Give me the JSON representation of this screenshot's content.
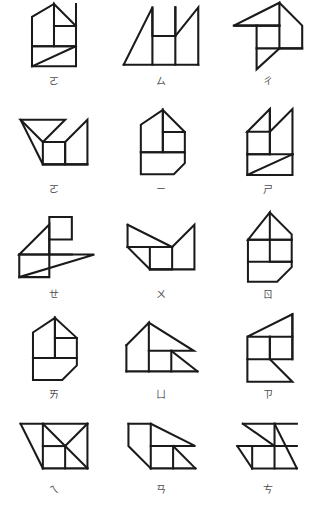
{
  "page": {
    "background_color": "#ffffff",
    "stroke_color": "#1a1a1a",
    "label_color": "#4d4d4d",
    "columns": 3,
    "rows": 5,
    "total_figures": 15
  },
  "figures": [
    {
      "index": 1,
      "row": 1,
      "column": 1,
      "label": "ㄛ",
      "name": "tangram-figure-1",
      "paths": [
        "M 8 46 L 8 14 L 32 0 L 32 46 Z",
        "M 32 46 L 32 24 L 56 24 L 56 46 Z",
        "M 32 24 L 32 0 L 56 24 Z",
        "M 56 46 L 56 0 L 56 46",
        "M 8 46 L 56 46",
        "M 8 46 L 8 68 L 56 68 L 56 46",
        "M 8 68 L 56 46"
      ],
      "viewbox": "-4 -4 72 80",
      "width": 66,
      "height": 76
    },
    {
      "index": 2,
      "row": 1,
      "column": 2,
      "label": "ㄙ",
      "name": "tangram-figure-2",
      "paths": [
        "M 2 66 L 32 6 L 32 66",
        "M 32 6 L 32 36 L 56 36 L 56 6 L 56 66",
        "M 32 36 L 56 36",
        "M 32 66 L 56 66",
        "M 56 36 L 80 6 L 80 66 L 56 66",
        "M 2 66 L 80 66"
      ],
      "viewbox": "-4 0 90 74",
      "width": 86,
      "height": 72
    },
    {
      "index": 3,
      "row": 1,
      "column": 3,
      "label": "ㄔ",
      "name": "tangram-figure-3",
      "paths": [
        "M 0 28 L 48 4 L 48 28 Z",
        "M 48 4 L 72 28 L 72 52 L 48 52 L 48 28 Z",
        "M 24 28 L 24 52 L 48 52 L 48 28 Z",
        "M 0 28 L 48 28",
        "M 24 52 L 48 52",
        "M 24 52 L 24 74 L 48 52",
        "M 48 52 L 72 52"
      ],
      "viewbox": "-4 0 80 80",
      "width": 76,
      "height": 78
    },
    {
      "index": 4,
      "row": 2,
      "column": 1,
      "label": "ㄛ",
      "name": "tangram-figure-4",
      "paths": [
        "M 2 22 L 50 22 L 26 46 Z",
        "M 2 22 L 26 70 L 26 46",
        "M 26 46 L 26 70 L 50 70 L 50 46 Z",
        "M 26 46 L 50 46",
        "M 50 46 L 50 70 L 74 70 L 74 22 L 50 46",
        "M 26 70 L 74 70"
      ],
      "viewbox": "-4 16 84 62",
      "width": 78,
      "height": 60
    },
    {
      "index": 5,
      "row": 2,
      "column": 2,
      "label": "ㄧ",
      "name": "tangram-figure-5",
      "paths": [
        "M 10 46 L 10 16 L 34 0 L 34 46 Z",
        "M 34 46 L 34 24 L 58 24 L 58 46 Z",
        "M 34 24 L 34 0 L 58 24 Z",
        "M 10 46 L 58 46",
        "M 10 46 L 10 70 L 46 70 L 58 58 L 58 46",
        "M 46 70 L 58 58"
      ],
      "viewbox": "-4 -4 72 80",
      "width": 66,
      "height": 76
    },
    {
      "index": 6,
      "row": 2,
      "column": 3,
      "label": "ㄕ",
      "name": "tangram-figure-6",
      "paths": [
        "M 8 24 L 32 0 L 32 24 Z",
        "M 8 24 L 8 48 L 32 48 L 32 24 Z",
        "M 32 48 L 32 0 L 56 0 L 56 48 Z",
        "M 8 24 L 56 24",
        "M 8 48 L 56 48",
        "M 8 48 L 8 70 L 56 70 L 56 48",
        "M 8 70 L 56 48"
      ],
      "viewbox": "-4 -4 68 80",
      "width": 64,
      "height": 76
    },
    {
      "index": 7,
      "row": 3,
      "column": 1,
      "label": "ㄝ",
      "name": "tangram-figure-7",
      "paths": [
        "M 8 40 L 40 8 L 40 40 Z",
        "M 40 8 L 40 0 L 40 24 L 64 24 L 64 0",
        "M 40 24 L 64 24",
        "M 8 40 L 64 40",
        "M 8 40 L 8 64 L 40 64 L 40 40",
        "M 8 64 L 40 64 L 88 40 L 40 40",
        "M 40 0 L 64 24"
      ],
      "viewbox": "-4 -4 98 74",
      "width": 92,
      "height": 70
    },
    {
      "index": 8,
      "row": 3,
      "column": 2,
      "label": "ㄨ",
      "name": "tangram-figure-8",
      "paths": [
        "M 2 8 L 2 32 L 26 32 L 50 8",
        "M 2 8 L 50 32 L 50 8",
        "M 2 32 L 26 56 L 26 32",
        "M 26 32 L 26 56 L 50 56 L 50 32 Z",
        "M 2 32 L 50 32",
        "M 26 56 L 74 56 L 74 8 L 50 32",
        "M 50 32 L 50 56"
      ],
      "viewbox": "-4 2 84 62",
      "width": 78,
      "height": 58
    },
    {
      "index": 9,
      "row": 3,
      "column": 3,
      "label": "ㄖ",
      "name": "tangram-figure-9",
      "paths": [
        "M 8 30 L 32 0 L 32 30 Z",
        "M 32 0 L 56 24 L 56 30 L 32 30 Z",
        "M 32 30 L 32 54 L 56 54 L 56 30",
        "M 8 30 L 56 30",
        "M 8 30 L 8 54 L 56 54",
        "M 8 54 L 8 76 L 40 76 L 56 60 L 56 54",
        "M 40 76 L 56 60"
      ],
      "viewbox": "-4 -4 68 86",
      "width": 62,
      "height": 80
    },
    {
      "index": 10,
      "row": 4,
      "column": 1,
      "label": "ㄞ",
      "name": "tangram-figure-10",
      "paths": [
        "M 8 44 L 8 16 L 32 0 L 32 44 Z",
        "M 32 44 L 32 22 L 56 22 L 56 44 Z",
        "M 32 22 L 32 0 L 56 22 Z",
        "M 8 44 L 56 44",
        "M 8 44 L 8 68 L 40 68 L 56 52 L 56 44",
        "M 40 68 L 56 52"
      ],
      "viewbox": "-4 -8 70 82",
      "width": 64,
      "height": 78
    },
    {
      "index": 11,
      "row": 4,
      "column": 2,
      "label": "ㄩ",
      "name": "tangram-figure-11",
      "paths": [
        "M 4 28 L 28 4 L 28 56",
        "M 4 28 L 4 56 L 28 56",
        "M 28 4 L 76 34 L 28 34",
        "M 28 34 L 52 34 L 52 56 L 28 56 Z",
        "M 52 34 L 80 56 L 52 56",
        "M 4 56 L 80 56"
      ],
      "viewbox": "-4 0 90 62",
      "width": 86,
      "height": 58
    },
    {
      "index": 12,
      "row": 4,
      "column": 3,
      "label": "ㄗ",
      "name": "tangram-figure-12",
      "paths": [
        "M 6 24 L 54 0 L 54 24 Z",
        "M 6 24 L 6 48 L 30 48 L 30 24 Z",
        "M 30 24 L 30 48 L 54 48 L 54 24 Z",
        "M 6 24 L 54 24",
        "M 54 0 L 54 48",
        "M 6 48 L 6 72 L 54 72 L 30 48",
        "M 30 48 L 54 72"
      ],
      "viewbox": "-4 -4 64 80",
      "width": 60,
      "height": 76
    },
    {
      "index": 13,
      "row": 5,
      "column": 1,
      "label": "ㄟ",
      "name": "tangram-figure-13",
      "paths": [
        "M 2 2 L 74 2 L 50 26 L 26 2",
        "M 2 2 L 26 50 L 26 2",
        "M 26 26 L 50 26 L 50 2",
        "M 26 26 L 26 50 L 50 50 L 50 26 Z",
        "M 50 26 L 74 2 L 74 50 L 50 50",
        "M 26 50 L 74 50",
        "M 50 26 L 74 50"
      ],
      "viewbox": "-4 -2 84 58",
      "width": 78,
      "height": 54
    },
    {
      "index": 14,
      "row": 5,
      "column": 2,
      "label": "ㄢ",
      "name": "tangram-figure-14",
      "paths": [
        "M 4 2 L 28 2 L 28 50",
        "M 4 2 L 4 26 L 28 50",
        "M 28 2 L 76 26 L 28 26",
        "M 28 26 L 52 26 L 52 50 L 28 50 Z",
        "M 52 26 L 76 50 L 52 50",
        "M 28 50 L 76 50"
      ],
      "viewbox": "-4 -2 86 58",
      "width": 80,
      "height": 54
    },
    {
      "index": 15,
      "row": 5,
      "column": 3,
      "label": "ㄘ",
      "name": "tangram-figure-15",
      "paths": [
        "M 8 2 L 66 2 L 42 26 L 8 2",
        "M 8 2 L 42 26 L 42 2",
        "M 2 26 L 66 26 L 66 2",
        "M 2 26 L 18 50 L 18 26",
        "M 18 26 L 18 50 L 42 50 L 42 26 Z",
        "M 42 26 L 42 50 L 66 50 L 66 26",
        "M 18 50 L 66 50",
        "M 42 2 L 66 50"
      ],
      "viewbox": "-4 -2 78 58",
      "width": 74,
      "height": 54
    }
  ]
}
